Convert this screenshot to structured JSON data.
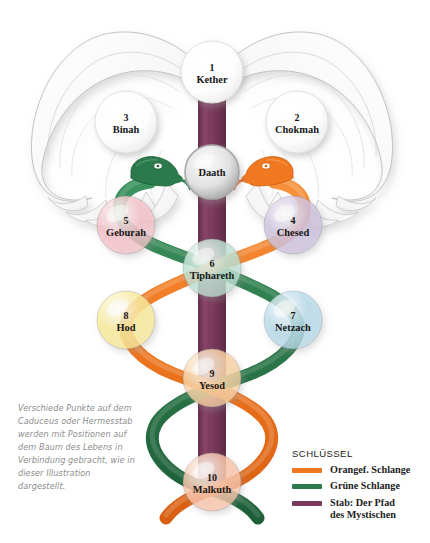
{
  "illustration": {
    "title": "Caduceus and Tree of Life",
    "sephirot": [
      {
        "number": "1",
        "name": "Kether",
        "color": "#ffffff",
        "cx": 212,
        "cy": 72,
        "r": 31
      },
      {
        "number": "2",
        "name": "Chokmah",
        "color": "#ffffff",
        "cx": 297,
        "cy": 122,
        "r": 31
      },
      {
        "number": "3",
        "name": "Binah",
        "color": "#ffffff",
        "cx": 126,
        "cy": 122,
        "r": 31
      },
      {
        "number": "",
        "name": "Daath",
        "color": "#d8d8d8",
        "cx": 212,
        "cy": 172,
        "r": 27
      },
      {
        "number": "4",
        "name": "Chesed",
        "color": "#cfc3e0",
        "cx": 293,
        "cy": 225,
        "r": 29
      },
      {
        "number": "5",
        "name": "Geburah",
        "color": "#f6c3cb",
        "cx": 126,
        "cy": 225,
        "r": 29
      },
      {
        "number": "6",
        "name": "Tiphareth",
        "color": "#bfe3d4",
        "cx": 212,
        "cy": 268,
        "r": 29
      },
      {
        "number": "7",
        "name": "Netzach",
        "color": "#b9dcec",
        "cx": 293,
        "cy": 320,
        "r": 29
      },
      {
        "number": "8",
        "name": "Hod",
        "color": "#fbeb9a",
        "cx": 126,
        "cy": 320,
        "r": 29
      },
      {
        "number": "9",
        "name": "Yesod",
        "color": "#fad3a4",
        "cx": 212,
        "cy": 378,
        "r": 29
      },
      {
        "number": "10",
        "name": "Malkuth",
        "color": "#fbc6ab",
        "cx": 212,
        "cy": 482,
        "r": 29
      }
    ],
    "colors": {
      "orange_snake": "#f07820",
      "green_snake": "#2c7a4b",
      "staff_purple": "#7a3a5c",
      "wing_outline": "#b9b9b9",
      "wing_fill": "#fcfcfc",
      "label_text": "#171717"
    }
  },
  "caption": {
    "text": "Verschiede Punkte auf dem Caduceus oder Hermesstab werden mit Positionen auf dem Baum des Lebens in Verbindung gebracht, wie in dieser Illustration dargestellt."
  },
  "legend": {
    "title": "SCHLÜSSEL",
    "items": [
      {
        "label": "Orangef. Schlange",
        "color": "#f07820"
      },
      {
        "label": "Grüne Schlange",
        "color": "#2c7a4b"
      },
      {
        "label": "Stab: Der Pfad\ndes Mystischen",
        "color": "#7a3a5c"
      }
    ]
  }
}
